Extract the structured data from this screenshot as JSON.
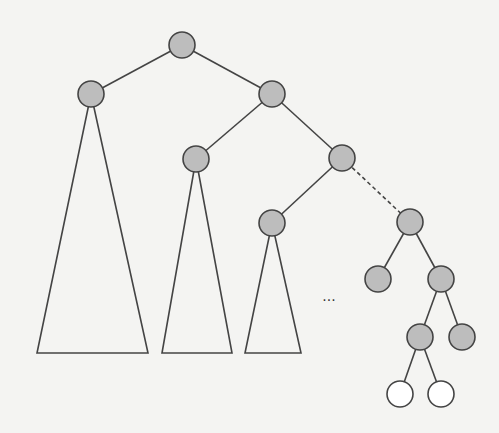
{
  "diagram": {
    "type": "binary-tree",
    "colors": {
      "background": "#f4f4f2",
      "line": "#444444",
      "filled_node": "#bdbdbd",
      "empty_node": "#ffffff"
    },
    "node_radius": 13,
    "nodes": [
      {
        "id": "root",
        "x": 182,
        "y": 45,
        "fill": "filled"
      },
      {
        "id": "l1-left",
        "x": 91,
        "y": 94,
        "fill": "filled"
      },
      {
        "id": "l1-right",
        "x": 272,
        "y": 94,
        "fill": "filled"
      },
      {
        "id": "l2-left",
        "x": 196,
        "y": 159,
        "fill": "filled"
      },
      {
        "id": "l2-right",
        "x": 342,
        "y": 158,
        "fill": "filled"
      },
      {
        "id": "l3-left",
        "x": 272,
        "y": 223,
        "fill": "filled"
      },
      {
        "id": "l3-right",
        "x": 410,
        "y": 222,
        "fill": "filled"
      },
      {
        "id": "l4-left",
        "x": 378,
        "y": 279,
        "fill": "filled"
      },
      {
        "id": "l4-right",
        "x": 441,
        "y": 279,
        "fill": "filled"
      },
      {
        "id": "l5-left",
        "x": 420,
        "y": 337,
        "fill": "filled"
      },
      {
        "id": "l5-right",
        "x": 462,
        "y": 337,
        "fill": "filled"
      },
      {
        "id": "l6-left",
        "x": 400,
        "y": 394,
        "fill": "empty"
      },
      {
        "id": "l6-right",
        "x": 441,
        "y": 394,
        "fill": "empty"
      }
    ],
    "edges": [
      {
        "from": "root",
        "to": "l1-left",
        "style": "solid"
      },
      {
        "from": "root",
        "to": "l1-right",
        "style": "solid"
      },
      {
        "from": "l1-right",
        "to": "l2-left",
        "style": "solid"
      },
      {
        "from": "l1-right",
        "to": "l2-right",
        "style": "solid"
      },
      {
        "from": "l2-right",
        "to": "l3-left",
        "style": "solid"
      },
      {
        "from": "l2-right",
        "to": "l3-right",
        "style": "dashed"
      },
      {
        "from": "l3-right",
        "to": "l4-left",
        "style": "solid"
      },
      {
        "from": "l3-right",
        "to": "l4-right",
        "style": "solid"
      },
      {
        "from": "l4-right",
        "to": "l5-left",
        "style": "solid"
      },
      {
        "from": "l4-right",
        "to": "l5-right",
        "style": "solid"
      },
      {
        "from": "l5-left",
        "to": "l6-left",
        "style": "solid"
      },
      {
        "from": "l5-left",
        "to": "l6-right",
        "style": "solid"
      }
    ],
    "subtrees": [
      {
        "root": "l1-left",
        "base_y": 353,
        "base_left": 37,
        "base_right": 148
      },
      {
        "root": "l2-left",
        "base_y": 353,
        "base_left": 162,
        "base_right": 232
      },
      {
        "root": "l3-left",
        "base_y": 353,
        "base_left": 245,
        "base_right": 301
      }
    ],
    "ellipsis": {
      "text": "...",
      "x": 329,
      "y": 301
    }
  }
}
